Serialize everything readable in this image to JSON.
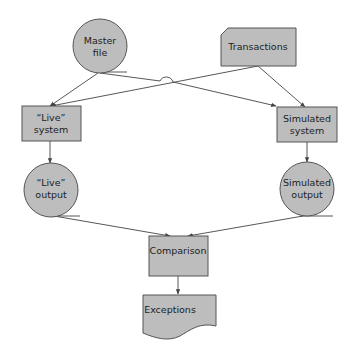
{
  "colors": {
    "shape_fill": "#bdbdbd",
    "shape_stroke": "#555555",
    "edge": "#444444",
    "background": "#ffffff"
  },
  "nodes": {
    "master_file": {
      "type": "magnetic-disk-circle",
      "line1": "Master",
      "line2": "file"
    },
    "transactions": {
      "type": "punched-card",
      "line1": "Transactions"
    },
    "live_system": {
      "type": "process-box",
      "line1": "“Live”",
      "line2": "system"
    },
    "simulated_system": {
      "type": "process-box",
      "line1": "Simulated",
      "line2": "system"
    },
    "live_output": {
      "type": "magnetic-disk-circle",
      "line1": "“Live”",
      "line2": "output"
    },
    "simulated_output": {
      "type": "magnetic-disk-circle",
      "line1": "Simulated",
      "line2": "output"
    },
    "comparison": {
      "type": "process-box",
      "line1": "Comparison"
    },
    "exceptions": {
      "type": "document",
      "line1": "Exceptions"
    }
  },
  "edges": [
    {
      "from": "Master file",
      "to": "“Live” system"
    },
    {
      "from": "Master file",
      "to": "Simulated system",
      "note": "line-jump over crossing"
    },
    {
      "from": "Transactions",
      "to": "“Live” system"
    },
    {
      "from": "Transactions",
      "to": "Simulated system"
    },
    {
      "from": "“Live” system",
      "to": "“Live” output"
    },
    {
      "from": "Simulated system",
      "to": "Simulated output"
    },
    {
      "from": "“Live” output",
      "to": "Comparison"
    },
    {
      "from": "Simulated output",
      "to": "Comparison"
    },
    {
      "from": "Comparison",
      "to": "Exceptions"
    }
  ]
}
